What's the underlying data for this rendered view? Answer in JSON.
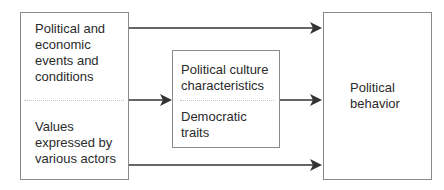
{
  "diagram": {
    "type": "flow",
    "nodes": {
      "inputs": {
        "sections": [
          {
            "id": "events",
            "label": "Political and\neconomic\nevents and\nconditions"
          },
          {
            "id": "values",
            "label": "Values\nexpressed by\nvarious actors"
          }
        ]
      },
      "culture": {
        "sections": [
          {
            "id": "characteristics",
            "label": "Political culture\ncharacteristics"
          },
          {
            "id": "traits",
            "label": "Democratic\ntraits"
          }
        ]
      },
      "behavior": {
        "id": "behavior",
        "label": "Political\nbehavior"
      }
    },
    "edges": [
      {
        "from": "inputs (top)",
        "to": "Political behavior"
      },
      {
        "from": "inputs (middle)",
        "to": "Political culture"
      },
      {
        "from": "Political culture",
        "to": "Political behavior"
      },
      {
        "from": "inputs (bottom)",
        "to": "Political behavior"
      }
    ],
    "colors": {
      "box_border": "#8a8a8a",
      "arrow": "#333333",
      "divider": "#c4c4c4",
      "text": "#2b2b2b"
    }
  }
}
